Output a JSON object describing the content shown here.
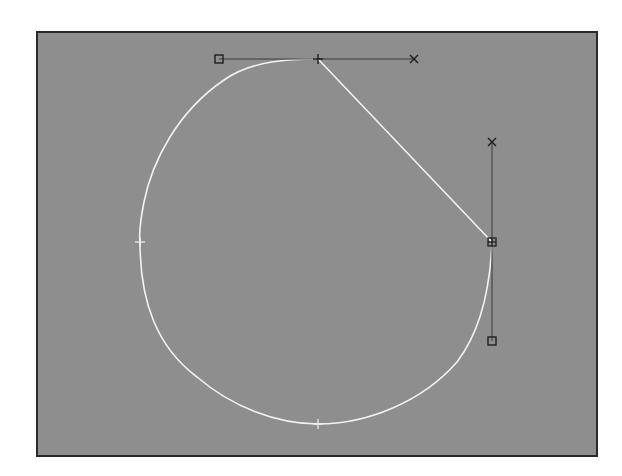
{
  "viewport": {
    "name": "spline-edit-viewport",
    "background": "#8e8e8e",
    "border_color": "#2a2a2a"
  },
  "spline": {
    "color": "#f2f2f2",
    "vertices": [
      {
        "name": "top-vertex",
        "x": 316,
        "y": 57,
        "marker": "plus"
      },
      {
        "name": "right-vertex-selected",
        "x": 490,
        "y": 240,
        "marker": "box-plus"
      },
      {
        "name": "bottom-vertex",
        "x": 316,
        "y": 422,
        "marker": "plus"
      },
      {
        "name": "left-vertex",
        "x": 138,
        "y": 240,
        "marker": "plus"
      }
    ]
  },
  "handles": {
    "color": "#3a3a3a",
    "top": {
      "in": {
        "x": 217,
        "y": 57,
        "marker": "square"
      },
      "out": {
        "x": 412,
        "y": 57,
        "marker": "x"
      }
    },
    "right": {
      "in": {
        "x": 490,
        "y": 140,
        "marker": "x"
      },
      "out": {
        "x": 490,
        "y": 339,
        "marker": "square"
      }
    }
  },
  "icons": {
    "vertex": "plus-icon",
    "selected_vertex": "box-plus-icon",
    "handle_square": "square-handle-icon",
    "handle_x": "x-handle-icon"
  }
}
